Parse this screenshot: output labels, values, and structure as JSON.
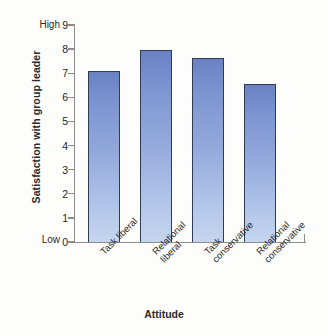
{
  "chart_data": {
    "type": "bar",
    "title": "",
    "xlabel": "Attitude",
    "ylabel": "Satisfaction with group leader",
    "categories": [
      "Task liberal",
      "Relational liberal",
      "Task conservative",
      "Relational conservative"
    ],
    "category_lines": [
      [
        "Task liberal"
      ],
      [
        "Relational",
        "liberal"
      ],
      [
        "Task",
        "conservative"
      ],
      [
        "Relational",
        "conservative"
      ]
    ],
    "values": [
      7.1,
      7.95,
      7.65,
      6.55
    ],
    "ylim": [
      0,
      9
    ],
    "yticks": [
      0,
      1,
      2,
      3,
      4,
      5,
      6,
      7,
      8,
      9
    ],
    "ytick_labels": [
      "0",
      "1",
      "2",
      "3",
      "4",
      "5",
      "6",
      "7",
      "8",
      "9"
    ],
    "y_axis_high_label": "High",
    "y_axis_low_label": "Low",
    "grid": false,
    "legend": false,
    "bar_color_top": "#6a82c3",
    "bar_color_bottom": "#c6d6ef",
    "bar_border_color": "#2e3d55",
    "axis_color": "#8c8c8c",
    "background": "#fdfdfc"
  }
}
